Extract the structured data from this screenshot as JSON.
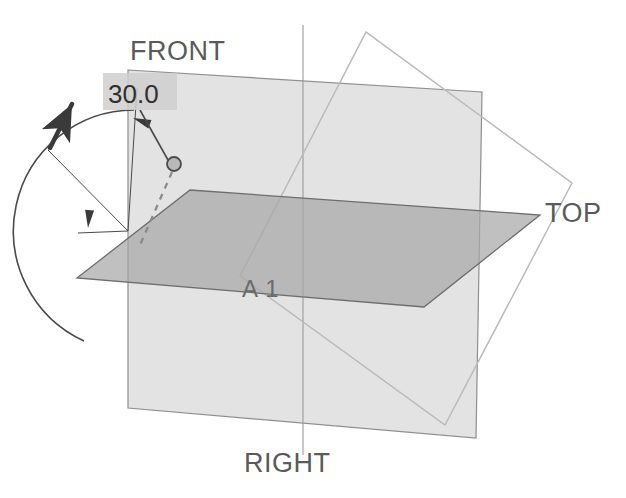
{
  "canvas": {
    "width": 626,
    "height": 498,
    "background": "#ffffff"
  },
  "colors": {
    "front_plane_fill": "#d2d2d2",
    "front_plane_stroke": "#8f8f8f",
    "top_plane_fill": "#a8a8a8",
    "top_plane_stroke": "#6d6d6d",
    "right_plane_fill": "none",
    "right_plane_stroke": "#bdbdbd",
    "dimension_line": "#4a4a4a",
    "leader_line": "#4a4a4a",
    "dashed_line": "#8a8a8a",
    "arrow_dark": "#3a3a3a",
    "label_text": "#5a5a5a",
    "value_text": "#2f2f2f",
    "value_box_fill": "#cfcfcf",
    "handle_fill": "#b9b9b9",
    "handle_stroke": "#4a4a4a",
    "axis_line": "#9a9a9a"
  },
  "labels": {
    "front_plane": "FRONT",
    "top_plane": "TOP",
    "right_plane": "RIGHT",
    "sketch_name": "A 1"
  },
  "label_positions": {
    "front_plane": {
      "x": 130,
      "y": 60
    },
    "top_plane": {
      "x": 545,
      "y": 222
    },
    "right_plane": {
      "x": 244,
      "y": 472
    },
    "sketch_name": {
      "x": 242,
      "y": 297
    }
  },
  "dimension": {
    "name": "angle-dimension",
    "value": "30.0",
    "unit": "degrees",
    "box": {
      "x": 103,
      "y": 73,
      "width": 74,
      "height": 37
    },
    "text_position": {
      "x": 108,
      "y": 103
    },
    "arc": {
      "center": {
        "x": 128,
        "y": 231
      },
      "radius": 121,
      "start_angle_deg": 90,
      "end_angle_deg": 60,
      "path": "M 84 341 A 121 121 0 0 1 134 110"
    },
    "arc_arrow_top": {
      "x": 133,
      "y": 118,
      "angle_deg": 200
    },
    "arc_arrow_bottom": {
      "x": 88,
      "y": 228,
      "angle_deg": 95
    }
  },
  "geometry": {
    "front_plane": {
      "name": "front-plane",
      "points": "128,70 482,92 476,438 128,408",
      "opacity": 0.62
    },
    "top_plane": {
      "name": "top-plane",
      "points": "77,278 190,190 540,215 424,307",
      "opacity": 0.72
    },
    "right_plane": {
      "name": "right-plane",
      "points": "366,32 572,183 445,425 240,276",
      "opacity": 1.0
    },
    "vertical_axis": {
      "x1": 303,
      "y1": 25,
      "x2": 303,
      "y2": 455
    },
    "right_plane_inner_edges": [
      {
        "x1": 366,
        "y1": 32,
        "x2": 240,
        "y2": 276
      },
      {
        "x1": 240,
        "y1": 276,
        "x2": 445,
        "y2": 425
      },
      {
        "x1": 366,
        "y1": 32,
        "x2": 572,
        "y2": 183
      },
      {
        "x1": 572,
        "y1": 183,
        "x2": 445,
        "y2": 425
      }
    ]
  },
  "leader": {
    "name": "dimension-leader",
    "segments": [
      {
        "x1": 140,
        "y1": 110,
        "x2": 168,
        "y2": 160
      }
    ],
    "handle": {
      "cx": 174,
      "cy": 164,
      "r": 7
    },
    "dashed": {
      "x1": 172,
      "y1": 172,
      "x2": 140,
      "y2": 245
    }
  },
  "direction_arrow": {
    "name": "normal-direction-arrow",
    "tail": {
      "x": 50,
      "y": 148
    },
    "tip": {
      "x": 72,
      "y": 104
    },
    "path": "M 50 148 L 72 104"
  },
  "extension_lines": [
    {
      "name": "extension-line-vertical",
      "x1": 128,
      "y1": 231,
      "x2": 137,
      "y2": 88
    },
    {
      "name": "extension-line-horizontal",
      "x1": 128,
      "y1": 231,
      "x2": 78,
      "y2": 233
    },
    {
      "name": "extension-line-angled",
      "x1": 128,
      "y1": 231,
      "x2": 48,
      "y2": 150
    }
  ],
  "misc": {
    "watermark_visible": true
  }
}
